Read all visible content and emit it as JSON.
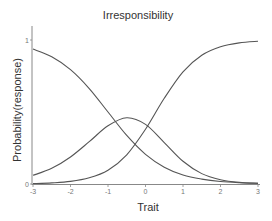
{
  "chart_data": {
    "type": "line",
    "title": "Irresponsibility",
    "xlabel": "Trait",
    "ylabel": "Probability(response)",
    "xlim": [
      -3,
      3
    ],
    "ylim": [
      0,
      1
    ],
    "xticks": [
      "-3",
      "-2",
      "-1",
      "0",
      "1",
      "2",
      "3"
    ],
    "yticks": [
      "0",
      "1"
    ],
    "grid": false,
    "legend": null,
    "x": [
      -3,
      -2.5,
      -2,
      -1.5,
      -1,
      -0.5,
      0,
      0.5,
      1,
      1.5,
      2,
      2.5,
      3
    ],
    "series": [
      {
        "name": "category 1 (decreasing)",
        "values": [
          0.937,
          0.883,
          0.794,
          0.663,
          0.5,
          0.337,
          0.206,
          0.117,
          0.063,
          0.034,
          0.017,
          0.009,
          0.005
        ]
      },
      {
        "name": "category 2 (middle)",
        "values": [
          0.06,
          0.109,
          0.188,
          0.294,
          0.404,
          0.46,
          0.414,
          0.288,
          0.158,
          0.072,
          0.03,
          0.011,
          0.004
        ]
      },
      {
        "name": "category 3 (increasing)",
        "values": [
          0.003,
          0.008,
          0.018,
          0.043,
          0.096,
          0.203,
          0.38,
          0.595,
          0.779,
          0.894,
          0.953,
          0.98,
          0.991
        ]
      }
    ],
    "line_color": "#555555",
    "axis_color": "#888888"
  }
}
